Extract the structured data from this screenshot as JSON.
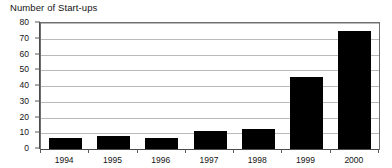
{
  "chart_data": {
    "type": "bar",
    "title": "Number of Start-ups",
    "xlabel": "",
    "ylabel": "",
    "categories": [
      "1994",
      "1995",
      "1996",
      "1997",
      "1998",
      "1999",
      "2000"
    ],
    "values": [
      7,
      8,
      7,
      11.5,
      13,
      46,
      75
    ],
    "ylim": [
      0,
      80
    ],
    "yticks": [
      0,
      10,
      20,
      30,
      40,
      50,
      60,
      70,
      80
    ],
    "ytick_labels": [
      "0",
      "10",
      "20",
      "30",
      "40",
      "50",
      "60",
      "70",
      "80"
    ],
    "grid": true,
    "grid_axis": "y",
    "legend": false,
    "bar_color": "#000000",
    "frame_color": "#6e6e6e",
    "gridline_color": "#b9b9b9",
    "axis_color": "#4a4a4a",
    "background": "#ffffff",
    "series": [
      {
        "name": "Number of Start-ups",
        "values": [
          7,
          8,
          7,
          11.5,
          13,
          46,
          75
        ]
      }
    ]
  }
}
